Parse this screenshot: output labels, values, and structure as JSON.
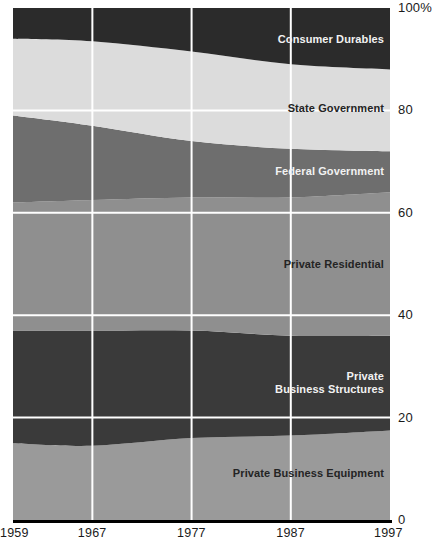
{
  "chart_data": {
    "type": "area",
    "title": "",
    "subtitle": "",
    "xlabel": "",
    "ylabel": "",
    "stacked": true,
    "normalized_percent": true,
    "grid": true,
    "legend_position": "inline-labels",
    "ylim": [
      0,
      100
    ],
    "xlim": [
      1959,
      1997
    ],
    "x": [
      1959,
      1967,
      1977,
      1987,
      1997
    ],
    "xtick_labels": [
      "1959",
      "1967",
      "1977",
      "1987",
      "1997"
    ],
    "ytick_values": [
      0,
      20,
      40,
      60,
      80,
      100
    ],
    "ytick_labels": [
      "0",
      "20",
      "40",
      "60",
      "80",
      "100%"
    ],
    "series": [
      {
        "name": "Private Business Equipment",
        "color": "#9a9a9a",
        "label_color": "on-light",
        "values": [
          15.0,
          14.5,
          16.0,
          16.5,
          17.5
        ]
      },
      {
        "name": "Private Business Structures",
        "color": "#3a3a3a",
        "label_color": "on-dark",
        "values": [
          22.0,
          22.5,
          21.0,
          19.5,
          18.5
        ]
      },
      {
        "name": "Private Residential",
        "color": "#8f8f8f",
        "label_color": "on-light",
        "values": [
          25.0,
          25.5,
          26.0,
          27.0,
          28.0
        ]
      },
      {
        "name": "Federal Government",
        "color": "#6e6e6e",
        "label_color": "on-dark",
        "values": [
          17.0,
          14.5,
          11.0,
          9.5,
          8.0
        ]
      },
      {
        "name": "State Government",
        "color": "#dcdcdc",
        "label_color": "on-light",
        "values": [
          15.0,
          16.5,
          17.5,
          16.5,
          16.0
        ]
      },
      {
        "name": "Consumer Durables",
        "color": "#2b2b2b",
        "label_color": "on-dark",
        "values": [
          6.0,
          6.5,
          8.5,
          11.0,
          12.0
        ]
      }
    ],
    "cumulative_tops": {
      "Private Business Equipment": [
        15.0,
        14.5,
        16.0,
        16.5,
        17.5
      ],
      "Private Business Structures": [
        37.0,
        37.0,
        37.0,
        36.0,
        36.0
      ],
      "Private Residential": [
        62.0,
        62.5,
        63.0,
        63.0,
        64.0
      ],
      "Federal Government": [
        79.0,
        77.0,
        74.0,
        72.5,
        72.0
      ],
      "State Government": [
        94.0,
        93.5,
        91.5,
        89.0,
        88.0
      ],
      "Consumer Durables": [
        100.0,
        100.0,
        100.0,
        100.0,
        100.0
      ]
    },
    "series_labels": [
      "Consumer Durables",
      "State Government",
      "Federal Government",
      "Private Residential",
      "Private\nBusiness Structures",
      "Private Business Equipment"
    ]
  },
  "axes": {
    "y": [
      {
        "label": "100%",
        "value": 100
      },
      {
        "label": "80",
        "value": 80
      },
      {
        "label": "60",
        "value": 60
      },
      {
        "label": "40",
        "value": 40
      },
      {
        "label": "20",
        "value": 20
      },
      {
        "label": "0",
        "value": 0
      }
    ],
    "x": [
      {
        "label": "1959",
        "value": 1959
      },
      {
        "label": "1967",
        "value": 1967
      },
      {
        "label": "1977",
        "value": 1977
      },
      {
        "label": "1987",
        "value": 1987
      },
      {
        "label": "1997",
        "value": 1997
      }
    ]
  },
  "colors": {
    "gridline": "#ffffff",
    "baseline": "#000000",
    "background": "#ffffff",
    "tick_text": "#1a1a1a"
  }
}
